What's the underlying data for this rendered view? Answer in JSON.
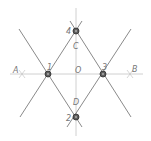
{
  "diagram": {
    "title": "",
    "colors": {
      "line": "#8a8a8a",
      "axis": "#b8b8b8",
      "point_fill": "#4a4a4a",
      "label": "#777777"
    },
    "axis_labels": [
      {
        "id": "A",
        "text": "A",
        "x": 19,
        "y": 73
      },
      {
        "id": "B",
        "text": "B",
        "x": 131,
        "y": 71
      },
      {
        "id": "O",
        "text": "O",
        "x": 77,
        "y": 72
      },
      {
        "id": "C",
        "text": "C",
        "x": 72,
        "y": 49
      },
      {
        "id": "D",
        "text": "D",
        "x": 72,
        "y": 102
      }
    ],
    "points": [
      {
        "id": "1",
        "text": "1",
        "x": 48,
        "y": 74,
        "label_x": 48,
        "label_y": 69
      },
      {
        "id": "2",
        "text": "2",
        "x": 76,
        "y": 117,
        "label_x": 67,
        "label_y": 120
      },
      {
        "id": "3",
        "text": "3",
        "x": 103,
        "y": 74,
        "label_x": 103,
        "label_y": 69
      },
      {
        "id": "4",
        "text": "4",
        "x": 76,
        "y": 31,
        "label_x": 67,
        "label_y": 34
      }
    ]
  }
}
